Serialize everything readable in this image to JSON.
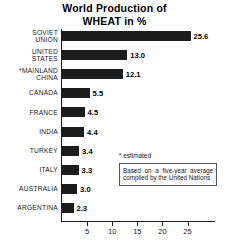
{
  "chart_data": {
    "type": "bar",
    "orientation": "horizontal",
    "title": "World Production of WHEAT in %",
    "title_lines": [
      "World Production of",
      "WHEAT in %"
    ],
    "xlabel": "",
    "ylabel": "",
    "xlim": [
      0,
      28
    ],
    "grid": false,
    "legend": null,
    "xticks": [
      5,
      10,
      15,
      20,
      25
    ],
    "xtick_labels": [
      "5",
      "10",
      "15",
      "20",
      "25"
    ],
    "categories": [
      "SOVIET UNION",
      "UNITED STATES",
      "*MAINLAND CHINA",
      "CANADA",
      "FRANCE",
      "INDIA",
      "TURKEY",
      "ITALY",
      "AUSTRALIA",
      "ARGENTINA"
    ],
    "values": [
      25.6,
      13.0,
      12.1,
      5.5,
      4.5,
      4.4,
      3.4,
      3.3,
      3.0,
      2.3
    ],
    "value_labels": [
      "25.6",
      "13.0",
      "12.1",
      "5.5",
      "4.5",
      "4.4",
      "3.4",
      "3.3",
      "3.0",
      "2.3"
    ],
    "bar_color": "#1c1c1c",
    "background_color": "#ffffff",
    "annotations": [
      "* estimated",
      "Based on a five-year average compiled by the United Nations"
    ]
  },
  "rows": [
    {
      "label": "SOVIET\nUNION",
      "value": 25.6,
      "value_label": "25.6",
      "lines": 2
    },
    {
      "label": "UNITED\nSTATES",
      "value": 13.0,
      "value_label": "13.0",
      "lines": 2
    },
    {
      "label": "*MAINLAND\nCHINA",
      "value": 12.1,
      "value_label": "12.1",
      "lines": 2
    },
    {
      "label": "CANADA",
      "value": 5.5,
      "value_label": "5.5",
      "lines": 1
    },
    {
      "label": "FRANCE",
      "value": 4.5,
      "value_label": "4.5",
      "lines": 1
    },
    {
      "label": "INDIA",
      "value": 4.4,
      "value_label": "4.4",
      "lines": 1
    },
    {
      "label": "TURKEY",
      "value": 3.4,
      "value_label": "3.4",
      "lines": 1
    },
    {
      "label": "ITALY",
      "value": 3.3,
      "value_label": "3.3",
      "lines": 1
    },
    {
      "label": "AUSTRALIA",
      "value": 3.0,
      "value_label": "3.0",
      "lines": 1
    },
    {
      "label": "ARGENTINA",
      "value": 2.3,
      "value_label": "2.3",
      "lines": 1
    }
  ],
  "notes": {
    "estimated": "* estimated",
    "source": "Based on a five-year average compiled by the United Nations"
  }
}
